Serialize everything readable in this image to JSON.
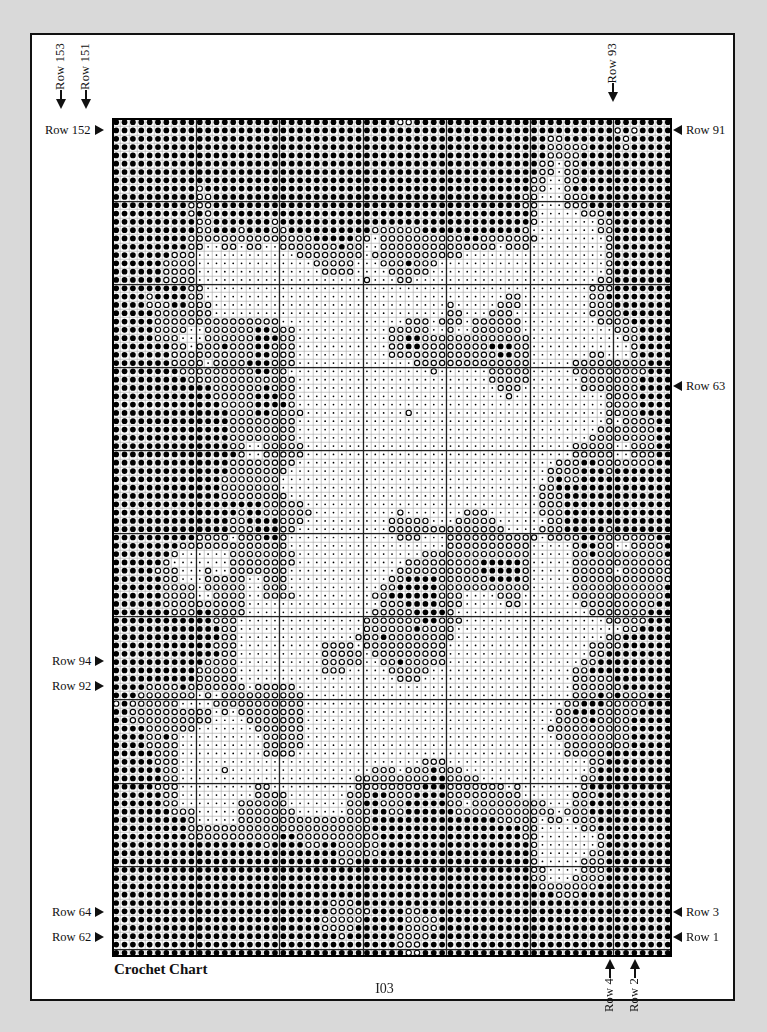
{
  "page": {
    "page_number": "I03",
    "caption": "Crochet Chart",
    "background_color": "#d9d9d9",
    "paper_color": "#ffffff",
    "border_color": "#111111"
  },
  "chart_data": {
    "type": "heatmap",
    "title": "Crochet Chart",
    "columns": 67,
    "rows": 101,
    "cell_size_px": 8.35,
    "major_gridline_every": 10,
    "symbols": [
      {
        "key": "filled",
        "name": "filled-circle",
        "color": "#000000",
        "meaning": "solid stitch"
      },
      {
        "key": "open",
        "name": "open-circle",
        "color": "#000000",
        "meaning": "open / ring stitch"
      },
      {
        "key": "dot",
        "name": "small-dot",
        "color": "#000000",
        "meaning": "background stitch"
      }
    ],
    "grid_color": "#9a9a9a",
    "major_grid_color": "#222222",
    "xlabel": "",
    "ylabel": "",
    "legend_position": "none"
  },
  "labels": {
    "top_left": [
      {
        "text": "Row 153",
        "orientation": "vertical",
        "arrow": "down",
        "col": 1
      },
      {
        "text": "Row 151",
        "orientation": "vertical",
        "arrow": "down",
        "col": 4
      }
    ],
    "top_right": [
      {
        "text": "Row 93",
        "orientation": "vertical",
        "arrow": "down",
        "col": 64
      }
    ],
    "left": [
      {
        "text": "Row 152",
        "orientation": "horizontal",
        "arrow": "right",
        "row": 2
      },
      {
        "text": "Row 94",
        "orientation": "horizontal",
        "arrow": "right",
        "row": 66
      },
      {
        "text": "Row 92",
        "orientation": "horizontal",
        "arrow": "right",
        "row": 69
      },
      {
        "text": "Row 64",
        "orientation": "horizontal",
        "arrow": "right",
        "row": 97
      },
      {
        "text": "Row 62",
        "orientation": "horizontal",
        "arrow": "right",
        "row": 100
      }
    ],
    "right": [
      {
        "text": "Row 91",
        "orientation": "horizontal",
        "arrow": "left",
        "row": 2
      },
      {
        "text": "Row 63",
        "orientation": "horizontal",
        "arrow": "left",
        "row": 33
      },
      {
        "text": "Row 3",
        "orientation": "horizontal",
        "arrow": "left",
        "row": 97
      },
      {
        "text": "Row 1",
        "orientation": "horizontal",
        "arrow": "left",
        "row": 100
      }
    ],
    "bottom_right": [
      {
        "text": "Row 4",
        "orientation": "vertical",
        "arrow": "up",
        "col": 61
      },
      {
        "text": "Row 2",
        "orientation": "vertical",
        "arrow": "up",
        "col": 64
      }
    ]
  }
}
